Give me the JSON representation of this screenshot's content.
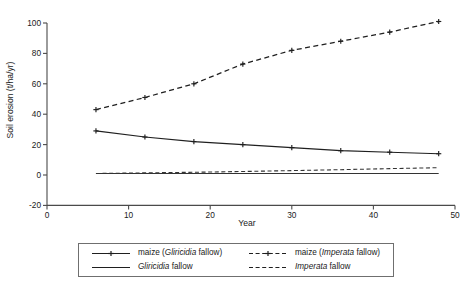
{
  "chart_data": {
    "type": "line",
    "title": "",
    "xlabel": "Year",
    "ylabel": "Soil erosion (t/ha/yr)",
    "xlim": [
      0,
      50
    ],
    "ylim": [
      -20,
      100
    ],
    "xticks": [
      0,
      10,
      20,
      30,
      40,
      50
    ],
    "yticks": [
      -20,
      0,
      20,
      40,
      60,
      80,
      100
    ],
    "grid": false,
    "legend_position": "below-plot",
    "x": [
      6,
      12,
      18,
      24,
      30,
      36,
      42,
      48
    ],
    "series": [
      {
        "name": "maize (Imperata fallow)",
        "name_italic_part": "Imperata",
        "style": "dashed-with-markers",
        "marker": "plus",
        "values": [
          43,
          51,
          60,
          73,
          82,
          88,
          94,
          101
        ]
      },
      {
        "name": "maize (Gliricidia fallow)",
        "name_italic_part": "Gliricidia",
        "style": "solid-with-markers",
        "marker": "plus",
        "values": [
          29,
          25,
          22,
          20,
          18,
          16,
          15,
          14
        ]
      },
      {
        "name": "Imperata fallow",
        "name_italic_part": "Imperata",
        "style": "dashed-plain",
        "marker": "none",
        "values": [
          1,
          1.4,
          1.8,
          2.3,
          2.9,
          3.5,
          4.2,
          4.8
        ]
      },
      {
        "name": "Gliricidia fallow",
        "name_italic_part": "Gliricidia",
        "style": "solid-plain",
        "marker": "none",
        "values": [
          1,
          1,
          1,
          1,
          1,
          1,
          1,
          1
        ]
      }
    ]
  },
  "axes": {
    "y_title": "Soil erosion (t/ha/yr)",
    "x_title": "Year",
    "y_tick_labels": [
      "100",
      "80",
      "60",
      "40",
      "20",
      "0",
      "-20"
    ],
    "x_tick_labels": [
      "0",
      "10",
      "20",
      "30",
      "40",
      "50"
    ]
  },
  "legend": {
    "entries": [
      {
        "swatch": "solid-with-plus-marker",
        "prefix": "maize (",
        "italic": "Gliricidia",
        "suffix": " fallow)"
      },
      {
        "swatch": "dashed-with-plus-marker",
        "prefix": "maize (",
        "italic": "Imperata",
        "suffix": " fallow)"
      },
      {
        "swatch": "solid-plain",
        "prefix": "",
        "italic": "Gliricidia",
        "suffix": " fallow"
      },
      {
        "swatch": "dashed-plain",
        "prefix": "",
        "italic": "Imperata",
        "suffix": " fallow"
      }
    ]
  },
  "colors": {
    "line": "#1f1f1f",
    "axis": "#4a4a4a",
    "background": "#ffffff",
    "legend_border": "#6f6f6f"
  }
}
